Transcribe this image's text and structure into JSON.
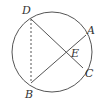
{
  "diagram": {
    "type": "circle-geometry",
    "circle": {
      "cx": 52,
      "cy": 52,
      "r": 40
    },
    "points": {
      "D": {
        "label": "D",
        "x": 31,
        "y": 19
      },
      "A": {
        "label": "A",
        "x": 86,
        "y": 35
      },
      "C": {
        "label": "C",
        "x": 83,
        "y": 68
      },
      "B": {
        "label": "B",
        "x": 31,
        "y": 83
      },
      "E": {
        "label": "E",
        "x": 67,
        "y": 53
      }
    },
    "segments": [
      {
        "from": "D",
        "to": "C",
        "style": "solid"
      },
      {
        "from": "B",
        "to": "A",
        "style": "solid"
      },
      {
        "from": "D",
        "to": "B",
        "style": "dashed"
      }
    ],
    "colors": {
      "stroke": "#555555",
      "label": "#333333"
    }
  }
}
